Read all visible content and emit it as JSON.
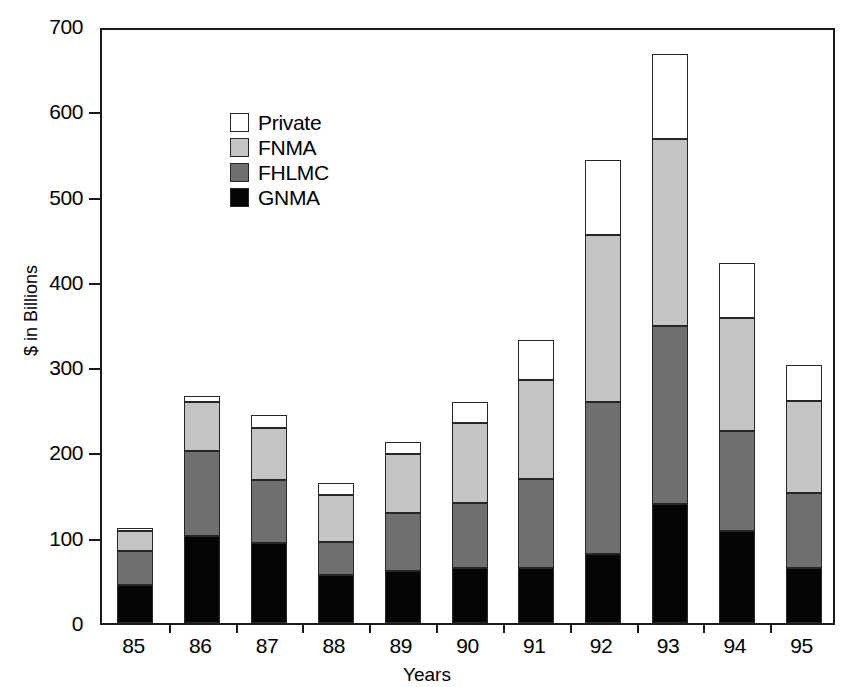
{
  "chart_data": {
    "type": "bar",
    "subtype": "stacked",
    "title": "",
    "xlabel": "Years",
    "ylabel": "$ in Billions",
    "categories": [
      "85",
      "86",
      "87",
      "88",
      "89",
      "90",
      "91",
      "92",
      "93",
      "94",
      "95"
    ],
    "ylim": [
      0,
      700
    ],
    "ytick_values": [
      0,
      100,
      200,
      300,
      400,
      500,
      600,
      700
    ],
    "ytick_labels": [
      "0",
      "100",
      "200",
      "300",
      "400",
      "500",
      "600",
      "700"
    ],
    "grid": false,
    "legend_position": "upper-left-inside",
    "series": [
      {
        "name": "GNMA",
        "color": "#050505",
        "values": [
          45,
          102,
          94,
          56,
          61,
          64,
          65,
          81,
          139,
          108,
          64
        ]
      },
      {
        "name": "FHLMC",
        "color": "#6f6f6f",
        "values": [
          40,
          100,
          74,
          39,
          68,
          77,
          104,
          178,
          209,
          117,
          88
        ]
      },
      {
        "name": "FNMA",
        "color": "#c4c4c4",
        "values": [
          23,
          57,
          61,
          55,
          69,
          94,
          116,
          196,
          220,
          133,
          108
        ]
      },
      {
        "name": "Private",
        "color": "#ffffff",
        "values": [
          3,
          7,
          15,
          14,
          14,
          24,
          47,
          88,
          99,
          64,
          43
        ]
      }
    ],
    "totals": [
      111,
      266,
      244,
      164,
      212,
      259,
      332,
      543,
      667,
      422,
      303
    ]
  },
  "legend": {
    "entries": [
      {
        "label": "Private",
        "swatch": "white-swatch"
      },
      {
        "label": "FNMA",
        "swatch": "light-gray-swatch"
      },
      {
        "label": "FHLMC",
        "swatch": "dark-gray-swatch"
      },
      {
        "label": "GNMA",
        "swatch": "black-swatch"
      }
    ]
  },
  "axes": {
    "y_title": "$ in Billions",
    "x_title": "Years"
  }
}
